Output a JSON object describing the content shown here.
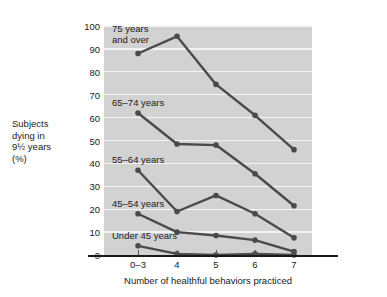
{
  "chart_data": {
    "type": "line",
    "title": "",
    "xlabel": "Number of healthful behaviors practiced",
    "ylabel": "Subjects dying in 9½ years (%)",
    "ylabel_lines": [
      "Subjects",
      "dying in",
      "9½ years",
      "(%)"
    ],
    "categories": [
      "0–3",
      "4",
      "5",
      "6",
      "7"
    ],
    "ylim": [
      0,
      100
    ],
    "yticks": [
      0,
      10,
      20,
      30,
      40,
      50,
      60,
      70,
      80,
      90,
      100
    ],
    "grid": true,
    "legend_position": "inline-annotations",
    "series": [
      {
        "name": "75 years and over",
        "label_lines": [
          "75 years",
          "and over"
        ],
        "values": [
          88,
          95.5,
          74.5,
          61,
          46
        ]
      },
      {
        "name": "65–74 years",
        "label_lines": [
          "65–74 years"
        ],
        "values": [
          62,
          48.5,
          48,
          35.5,
          21.5
        ]
      },
      {
        "name": "55–64 years",
        "label_lines": [
          "55–64 years"
        ],
        "values": [
          37,
          19,
          26,
          18,
          7.5
        ]
      },
      {
        "name": "45–54 years",
        "label_lines": [
          "45–54 years"
        ],
        "values": [
          18,
          10,
          8.5,
          6.5,
          1.5
        ]
      },
      {
        "name": "Under 45 years",
        "label_lines": [
          "Under 45 years"
        ],
        "values": [
          4,
          0.5,
          0,
          0.5,
          0
        ]
      }
    ],
    "colors": {
      "plot_background": "#d2d2d2",
      "gridline": "#f4f4f4",
      "line": "#4a4a4a",
      "marker": "#4a4a4a",
      "axis": "#1a1a1a",
      "text": "#1a1a1a",
      "page_background": "#ffffff"
    }
  }
}
